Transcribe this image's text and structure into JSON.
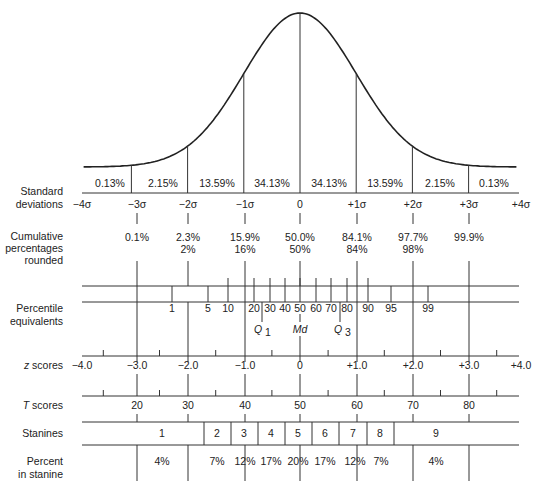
{
  "chart_data": {
    "type": "diagram",
    "curve": "standard normal distribution",
    "sd_positions": [
      -4,
      -3,
      -2,
      -1,
      0,
      1,
      2,
      3,
      4
    ],
    "area_percentages": [
      "0.13%",
      "2.15%",
      "13.59%",
      "34.13%",
      "34.13%",
      "13.59%",
      "2.15%",
      "0.13%"
    ],
    "rows": {
      "standard_deviations": {
        "label": [
          "Standard",
          "deviations"
        ],
        "ticks": [
          "−4σ",
          "−3σ",
          "−2σ",
          "−1σ",
          "0",
          "+1σ",
          "+2σ",
          "+3σ",
          "+4σ"
        ]
      },
      "cumulative_percentages": {
        "label": [
          "Cumulative",
          "percentages",
          "rounded"
        ],
        "exact": [
          "0.1%",
          "2.3%",
          "15.9%",
          "50.0%",
          "84.1%",
          "97.7%",
          "99.9%"
        ],
        "rounded": [
          "",
          "2%",
          "16%",
          "50%",
          "84%",
          "98%",
          ""
        ]
      },
      "percentile_equivalents": {
        "label": [
          "Percentile",
          "equivalents"
        ],
        "ticks": [
          "1",
          "5",
          "10",
          "20",
          "30",
          "40",
          "50",
          "60",
          "70",
          "80",
          "90",
          "95",
          "99"
        ],
        "quartiles": [
          "Q",
          "Md",
          "Q"
        ],
        "quartile_subs": [
          "1",
          "",
          "3"
        ]
      },
      "z_scores": {
        "label_italic": "z",
        "label_rest": " scores",
        "ticks": [
          "−4.0",
          "−3.0",
          "−2.0",
          "−1.0",
          "0",
          "+1.0",
          "+2.0",
          "+3.0",
          "+4.0"
        ]
      },
      "t_scores": {
        "label_italic": "T",
        "label_rest": " scores",
        "ticks": [
          "20",
          "30",
          "40",
          "50",
          "60",
          "70",
          "80"
        ]
      },
      "stanines": {
        "label": "Stanines",
        "values": [
          "1",
          "2",
          "3",
          "4",
          "5",
          "6",
          "7",
          "8",
          "9"
        ]
      },
      "percent_in_stanine": {
        "label": [
          "Percent",
          "in stanine"
        ],
        "values": [
          "4%",
          "7%",
          "12%",
          "17%",
          "20%",
          "17%",
          "12%",
          "7%",
          "4%"
        ]
      }
    }
  }
}
